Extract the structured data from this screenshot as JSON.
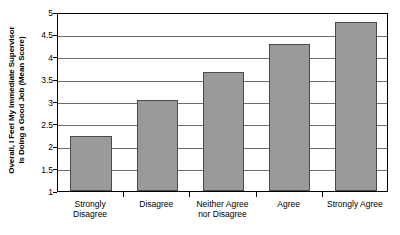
{
  "chart_data": {
    "type": "bar",
    "title": "",
    "xlabel": "",
    "ylabel": "Overall, I Feel My Immediate Supervisor Is Doing a Good Job (Mean Score)",
    "ylabel_lines": [
      "Overall, I Feel My Immediate Supervisor",
      "Is Doing a Good Job (Mean Score)"
    ],
    "categories": [
      "Strongly Disagree",
      "Disagree",
      "Neither Agree nor Disagree",
      "Agree",
      "Strongly Agree"
    ],
    "category_lines": [
      [
        "Strongly",
        "Disagree"
      ],
      [
        "Disagree"
      ],
      [
        "Neither Agree",
        "nor Disagree"
      ],
      [
        "Agree"
      ],
      [
        "Strongly Agree"
      ]
    ],
    "values": [
      2.22,
      3.03,
      3.65,
      4.28,
      4.77
    ],
    "ylim": [
      1,
      5
    ],
    "ytick_labels": [
      "1",
      "1.5",
      "2",
      "2.5",
      "3",
      "3.5",
      "4",
      "4.5",
      "5"
    ],
    "ytick_values": [
      1,
      1.5,
      2,
      2.5,
      3,
      3.5,
      4,
      4.5,
      5
    ],
    "grid": true,
    "legend": false,
    "bar_fill_color": "#9a9a9a",
    "bar_border_color": "#4a4a4a",
    "gridline_color": "#6f6f6f",
    "axis_color": "#000000",
    "background_color": "#ffffff"
  }
}
